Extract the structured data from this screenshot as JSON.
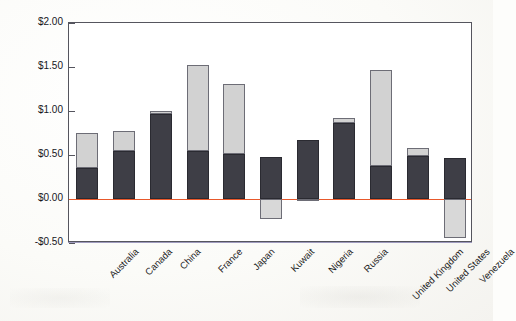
{
  "chart_data": {
    "type": "bar",
    "title": "",
    "subtitle": "",
    "xlabel": "",
    "ylabel": "Price (US$/liter)",
    "ylim": [
      -0.5,
      2.0
    ],
    "ytick_labels": [
      "$2.00",
      "$1.50",
      "$1.00",
      "$0.50",
      "$0.00",
      "-$0.50"
    ],
    "ytick_values": [
      2.0,
      1.5,
      1.0,
      0.5,
      0.0,
      -0.5
    ],
    "grid": false,
    "legend_position": "none",
    "stacked": true,
    "zero_line": true,
    "categories": [
      "Australia",
      "Canada",
      "China",
      "France",
      "Japan",
      "Kuwait",
      "Nigeria",
      "Russia",
      "United Kingdom",
      "United States",
      "Venezuela"
    ],
    "series": [
      {
        "name": "Base price",
        "color": "#3e3e46",
        "values": [
          0.35,
          0.54,
          0.97,
          0.55,
          0.51,
          0.48,
          0.67,
          0.86,
          0.37,
          0.49,
          0.47
        ]
      },
      {
        "name": "Tax or subsidy",
        "color": "#d2d2d2",
        "values": [
          0.4,
          0.23,
          0.03,
          0.97,
          0.8,
          -0.23,
          -0.02,
          0.06,
          1.1,
          0.09,
          -0.44
        ]
      }
    ],
    "totals": [
      0.75,
      0.77,
      1.0,
      1.52,
      1.31,
      0.25,
      0.65,
      0.92,
      1.47,
      0.58,
      0.03
    ]
  },
  "colors": {
    "base_fill": "#3e3e46",
    "tax_fill": "#d2d2d2",
    "bar_outline": "#6d6d76",
    "frame": "#55555e",
    "zero_line": "#e8592c",
    "baseline_blue": "#6f7fd8",
    "axis_text": "#16161c",
    "plot_background": "#ffffff",
    "page_background": "#fdfdfb"
  }
}
